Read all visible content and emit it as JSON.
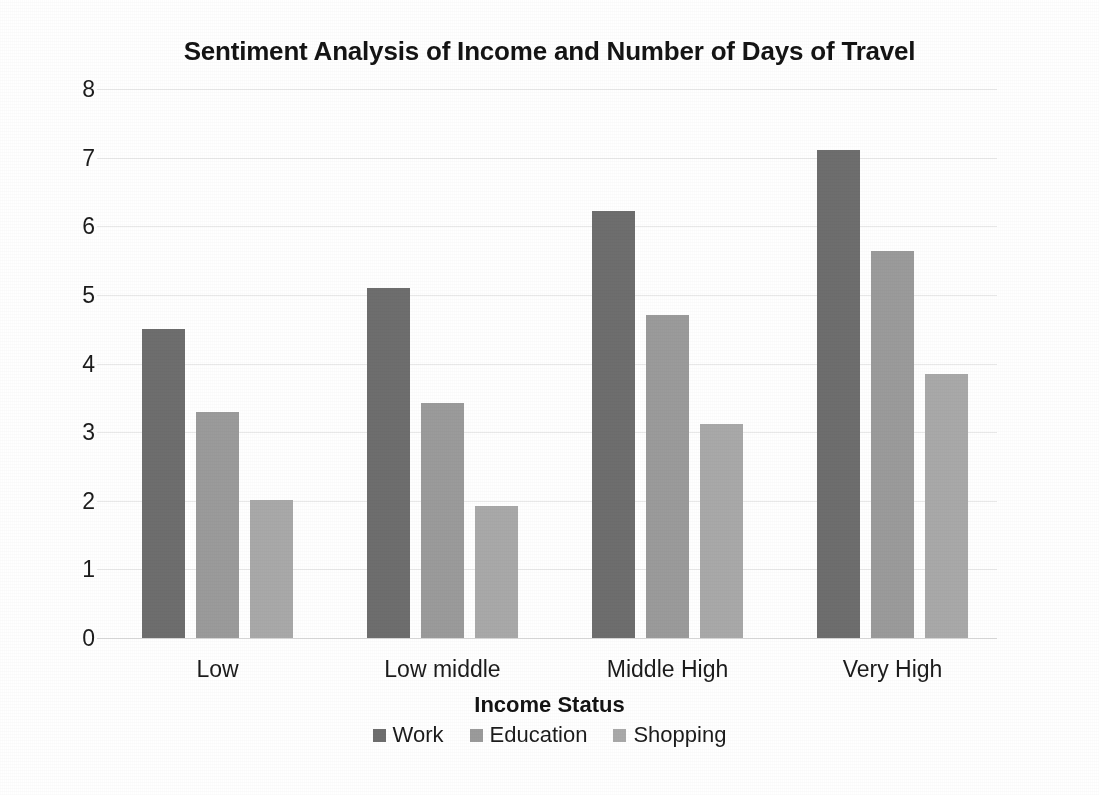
{
  "chart_data": {
    "type": "bar",
    "title": "Sentiment Analysis of Income and Number of Days of Travel",
    "xlabel": "Income Status",
    "ylabel": "Number of Days",
    "categories": [
      "Low",
      "Low middle",
      "Middle High",
      "Very High"
    ],
    "series": [
      {
        "name": "Work",
        "values": [
          4.5,
          5.1,
          6.22,
          7.11
        ],
        "color": "#6e6e6e"
      },
      {
        "name": "Education",
        "values": [
          3.3,
          3.43,
          4.71,
          5.64
        ],
        "color": "#9b9b9b"
      },
      {
        "name": "Shopping",
        "values": [
          2.01,
          1.93,
          3.12,
          3.85
        ],
        "color": "#a9a9a9"
      }
    ],
    "ylim": [
      0,
      8
    ],
    "ytick_labels": [
      "0",
      "1",
      "2",
      "3",
      "4",
      "5",
      "6",
      "7",
      "8"
    ],
    "ytick_values": [
      0,
      1,
      2,
      3,
      4,
      5,
      6,
      7,
      8
    ],
    "grid": true,
    "grid_axis": "y",
    "legend_position": "bottom",
    "bar_group_count": 4,
    "series_count": 3
  },
  "colors": {
    "background": "#ffffff",
    "text": "#1c1c1c",
    "gridline": "#e9e9e9",
    "baseline": "#d9d9d9",
    "work": "#6e6e6e",
    "education": "#9b9b9b",
    "shopping": "#a9a9a9"
  }
}
